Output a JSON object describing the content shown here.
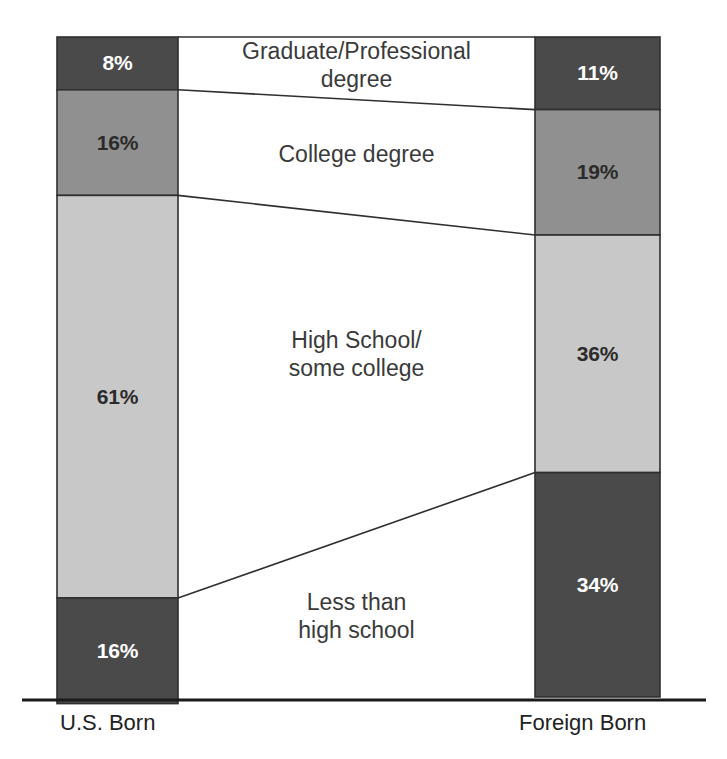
{
  "chart_data": {
    "type": "bar",
    "subtype": "paired-stacked-100-percent-with-connectors",
    "title": "",
    "subtitle": "",
    "xlabel": "",
    "ylabel": "",
    "ylim": [
      0,
      100
    ],
    "grid": false,
    "legend_position": "center-between-bars",
    "categories": [
      "U.S. Born",
      "Foreign Born"
    ],
    "stack_order_top_to_bottom": [
      "Graduate/Professional degree",
      "College degree",
      "High School/\nsome college",
      "Less than\nhigh school"
    ],
    "series": [
      {
        "name": "Graduate/Professional degree",
        "values": [
          8,
          11
        ]
      },
      {
        "name": "College degree",
        "values": [
          16,
          19
        ]
      },
      {
        "name": "High School/\nsome college",
        "values": [
          61,
          36
        ]
      },
      {
        "name": "Less than\nhigh school",
        "values": [
          16,
          34
        ]
      }
    ],
    "value_labels": {
      "U.S. Born": [
        "8%",
        "16%",
        "61%",
        "16%"
      ],
      "Foreign Born": [
        "11%",
        "19%",
        "36%",
        "34%"
      ]
    }
  },
  "colors": {
    "segment_dark": "#4a4a4a",
    "segment_medium": "#909090",
    "segment_light": "#c8c8c8",
    "segment_outline": "#2f2f2f",
    "connector_line": "#2f2f2f",
    "axis_line": "#1a1a1a",
    "label_text": "#3a3a3a",
    "value_text_on_dark": "#ffffff",
    "value_text_on_light": "#2b2b2b",
    "background": "#ffffff"
  },
  "bars": {
    "left": {
      "axis_label": "U.S. Born",
      "segments": [
        {
          "label": "8%",
          "value": 8,
          "fill_key": "segment_dark",
          "text_tone": "on-dark"
        },
        {
          "label": "16%",
          "value": 16,
          "fill_key": "segment_medium",
          "text_tone": "on-light"
        },
        {
          "label": "61%",
          "value": 61,
          "fill_key": "segment_light",
          "text_tone": "on-light"
        },
        {
          "label": "16%",
          "value": 16,
          "fill_key": "segment_dark",
          "text_tone": "on-dark"
        }
      ]
    },
    "right": {
      "axis_label": "Foreign Born",
      "segments": [
        {
          "label": "11%",
          "value": 11,
          "fill_key": "segment_dark",
          "text_tone": "on-dark"
        },
        {
          "label": "19%",
          "value": 19,
          "fill_key": "segment_medium",
          "text_tone": "on-light"
        },
        {
          "label": "36%",
          "value": 36,
          "fill_key": "segment_light",
          "text_tone": "on-light"
        },
        {
          "label": "34%",
          "value": 34,
          "fill_key": "segment_dark",
          "text_tone": "on-dark"
        }
      ]
    }
  },
  "center_labels": [
    {
      "text": "Graduate/Professional\ndegree",
      "center_y": 66
    },
    {
      "text": "College degree",
      "center_y": 155
    },
    {
      "text": "High School/\nsome college",
      "center_y": 355
    },
    {
      "text": "Less than\nhigh school",
      "center_y": 617
    }
  ],
  "geometry": {
    "left_bar_x": 57,
    "left_bar_width": 121,
    "right_bar_x": 535,
    "right_bar_width": 125,
    "chart_top": 37,
    "chart_bottom": 697,
    "axis_y": 700,
    "axis_x_start": 22,
    "axis_x_end": 706,
    "axis_label_y": 712
  }
}
